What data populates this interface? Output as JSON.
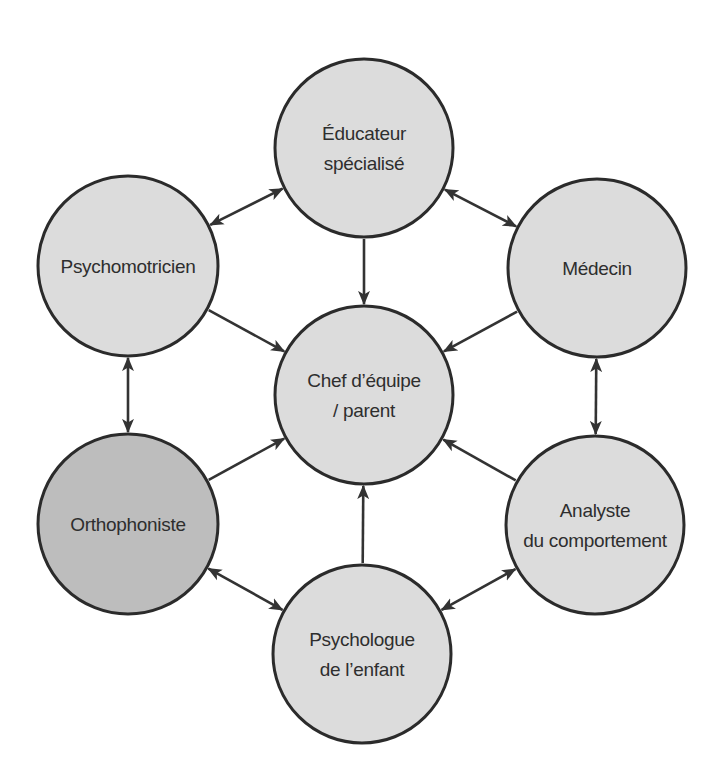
{
  "diagram": {
    "title": "",
    "colors": {
      "node_fill": "#dcdcdc",
      "node_fill_highlight": "#bdbdbd",
      "node_stroke": "#2b2b2b",
      "edge": "#333333",
      "text": "#2e2e2e"
    },
    "nodes": [
      {
        "id": "educateur",
        "lines": [
          "Éducateur",
          "spécialisé"
        ],
        "cx": 364,
        "cy": 148,
        "r": 89,
        "highlight": false
      },
      {
        "id": "psychomotricien",
        "lines": [
          "Psychomotricien"
        ],
        "cx": 128,
        "cy": 266,
        "r": 90,
        "highlight": false
      },
      {
        "id": "medecin",
        "lines": [
          "Médecin"
        ],
        "cx": 597,
        "cy": 268,
        "r": 89,
        "highlight": false
      },
      {
        "id": "chef",
        "lines": [
          "Chef d’équipe",
          "/ parent"
        ],
        "cx": 364,
        "cy": 395,
        "r": 89,
        "highlight": false
      },
      {
        "id": "orthophoniste",
        "lines": [
          "Orthophoniste"
        ],
        "cx": 128,
        "cy": 524,
        "r": 90,
        "highlight": true
      },
      {
        "id": "analyste",
        "lines": [
          "Analyste",
          "du comportement"
        ],
        "cx": 595,
        "cy": 525,
        "r": 89,
        "highlight": false
      },
      {
        "id": "psychologue",
        "lines": [
          "Psychologue",
          "de l’enfant"
        ],
        "cx": 362,
        "cy": 654,
        "r": 89,
        "highlight": false
      }
    ],
    "edges": [
      {
        "from": "educateur",
        "to": "psychomotricien",
        "direction": "both"
      },
      {
        "from": "educateur",
        "to": "medecin",
        "direction": "both"
      },
      {
        "from": "educateur",
        "to": "chef",
        "direction": "forward"
      },
      {
        "from": "psychomotricien",
        "to": "chef",
        "direction": "forward"
      },
      {
        "from": "medecin",
        "to": "chef",
        "direction": "forward"
      },
      {
        "from": "psychomotricien",
        "to": "orthophoniste",
        "direction": "both"
      },
      {
        "from": "medecin",
        "to": "analyste",
        "direction": "both"
      },
      {
        "from": "orthophoniste",
        "to": "chef",
        "direction": "forward"
      },
      {
        "from": "analyste",
        "to": "chef",
        "direction": "forward"
      },
      {
        "from": "psychologue",
        "to": "chef",
        "direction": "forward"
      },
      {
        "from": "orthophoniste",
        "to": "psychologue",
        "direction": "both"
      },
      {
        "from": "analyste",
        "to": "psychologue",
        "direction": "both"
      }
    ]
  }
}
